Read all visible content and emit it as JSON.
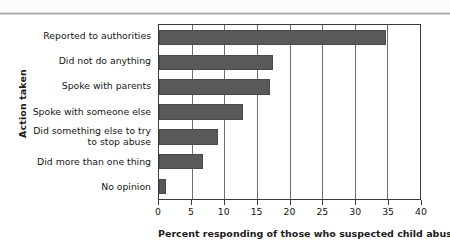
{
  "chart_data": {
    "type": "bar",
    "orientation": "horizontal",
    "title": "",
    "xlabel": "Percent responding of those who suspected child abuse",
    "ylabel": "Action taken",
    "xlim": [
      0,
      40
    ],
    "xticks": [
      0,
      5,
      10,
      15,
      20,
      25,
      30,
      35,
      40
    ],
    "xtick_labels": [
      "0",
      "5",
      "10",
      "15",
      "20",
      "25",
      "30",
      "35",
      "40"
    ],
    "grid": "vertical",
    "legend": null,
    "bar_color": "#595959",
    "categories": [
      "Reported to authorities",
      "Did not do anything",
      "Spoke with parents",
      "Spoke with someone else",
      "Did something else to try\nto stop abuse",
      "Did more than one thing",
      "No opinion"
    ],
    "category_lines": [
      [
        "Reported to authorities"
      ],
      [
        "Did not do anything"
      ],
      [
        "Spoke with parents"
      ],
      [
        "Spoke with someone else"
      ],
      [
        "Did something else to try",
        "to stop abuse"
      ],
      [
        "Did more than one thing"
      ],
      [
        "No opinion"
      ]
    ],
    "values": [
      34.8,
      17.5,
      17.0,
      12.9,
      9.0,
      6.8,
      1.0
    ]
  }
}
